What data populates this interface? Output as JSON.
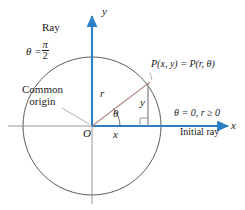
{
  "figure": {
    "colors": {
      "axis_blue": "#2b7fc4",
      "circle_gray": "#4a4a4a",
      "radius_rose": "#b58b82",
      "leg_gray": "#8c8c8c",
      "text_black": "#1a1a1a",
      "background": "#ffffff"
    },
    "labels": {
      "ray": "Ray",
      "theta_half_pi_prefix": "θ =",
      "theta_half_pi_numerator": "π",
      "theta_half_pi_denominator": "2",
      "y_axis": "y",
      "x_axis": "x",
      "point": "P(x, y) = P(r, θ)",
      "common_origin_line1": "Common",
      "common_origin_line2": "origin",
      "radius": "r",
      "vertical_leg": "y",
      "angle": "θ",
      "horizontal_leg": "x",
      "origin": "O",
      "theta_zero": "θ = 0, r ≥ 0",
      "initial_ray": "Initial ray"
    },
    "geometry": {
      "origin_x": 92,
      "origin_y": 126,
      "circle_radius": 69,
      "point_x": 148,
      "point_y": 85,
      "right_angle_size": 8
    }
  }
}
